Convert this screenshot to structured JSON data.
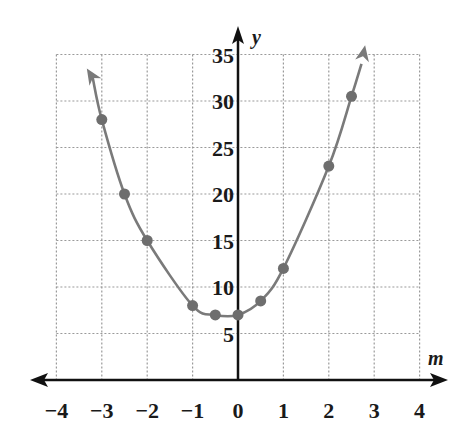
{
  "chart_data": {
    "type": "scatter",
    "title": "",
    "xlabel": "m",
    "ylabel": "y",
    "xlim": [
      -4,
      4
    ],
    "ylim": [
      0,
      35
    ],
    "grid": true,
    "legend": "none",
    "x_ticks": [
      "−4",
      "−3",
      "−2",
      "−1",
      "0",
      "1",
      "2",
      "3",
      "4"
    ],
    "y_ticks": [
      "5",
      "10",
      "15",
      "20",
      "25",
      "30",
      "35"
    ],
    "series": [
      {
        "name": "data points",
        "x": [
          -3,
          -2.5,
          -2,
          -1,
          -0.5,
          0,
          0.5,
          1,
          2,
          2.5
        ],
        "y": [
          28,
          20,
          15,
          8,
          7,
          7,
          8.5,
          12,
          23,
          30.5
        ]
      }
    ],
    "curve": {
      "name": "fitted parabola",
      "description": "smooth U-shaped curve through points with arrows at both ends",
      "vertex_approx": [
        -0.25,
        6.8
      ],
      "x_range": [
        -3.2,
        2.7
      ]
    },
    "colors": {
      "curve": "#7a7a7a",
      "points": "#6e6e6e",
      "axes": "#111111",
      "grid": "#9a9a9a"
    }
  }
}
